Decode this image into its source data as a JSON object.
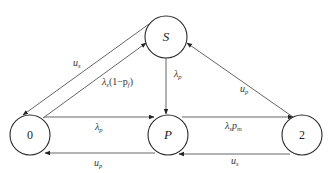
{
  "diagram": {
    "type": "state-transition",
    "nodes": [
      {
        "id": "S",
        "label": "S",
        "cx": 166,
        "cy": 37,
        "r": 21
      },
      {
        "id": "0",
        "label": "0",
        "cx": 30,
        "cy": 135,
        "r": 20
      },
      {
        "id": "P",
        "label": "P",
        "cx": 168,
        "cy": 135,
        "r": 20
      },
      {
        "id": "2",
        "label": "2",
        "cx": 302,
        "cy": 135,
        "r": 20
      }
    ],
    "edges": [
      {
        "from": "S",
        "to": "0",
        "label_main": "u",
        "label_sub": "s"
      },
      {
        "from": "0",
        "to": "S",
        "label_main": "λ",
        "label_sub": "s",
        "label_rest": "(1−p",
        "label_sub2": "f",
        "label_end": ")"
      },
      {
        "from": "S",
        "to": "P",
        "label_main": "λ",
        "label_sub": "p"
      },
      {
        "from": "0",
        "to": "P",
        "label_main": "λ",
        "label_sub": "p"
      },
      {
        "from": "P",
        "to": "2",
        "label_main": "λ",
        "label_sub": "s",
        "label_rest": "p",
        "label_sub2": "m"
      },
      {
        "from": "2",
        "to": "S",
        "label_main": "u",
        "label_sub": "p"
      },
      {
        "from": "P",
        "to": "0",
        "label_main": "u",
        "label_sub": "p"
      },
      {
        "from": "2",
        "to": "P",
        "label_main": "u",
        "label_sub": "s"
      }
    ]
  }
}
